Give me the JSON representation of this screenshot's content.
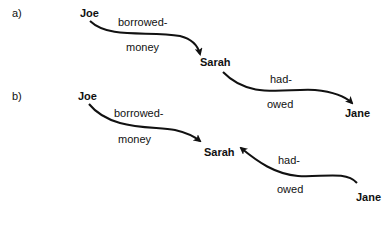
{
  "diagram_a": {
    "label": "a)",
    "nodes": {
      "joe": "Joe",
      "sarah": "Sarah",
      "jane": "Jane"
    },
    "edges": [
      {
        "from": "Joe",
        "to": "Sarah",
        "label_top": "borrowed-",
        "label_bottom": "money"
      },
      {
        "from": "Sarah",
        "to": "Jane",
        "label_top": "had-",
        "label_bottom": "owed"
      }
    ]
  },
  "diagram_b": {
    "label": "b)",
    "nodes": {
      "joe": "Joe",
      "sarah": "Sarah",
      "jane": "Jane"
    },
    "edges": [
      {
        "from": "Joe",
        "to": "Sarah",
        "label_top": "borrowed-",
        "label_bottom": "money"
      },
      {
        "from": "Jane",
        "to": "Sarah",
        "label_top": "had-",
        "label_bottom": "owed"
      }
    ]
  }
}
